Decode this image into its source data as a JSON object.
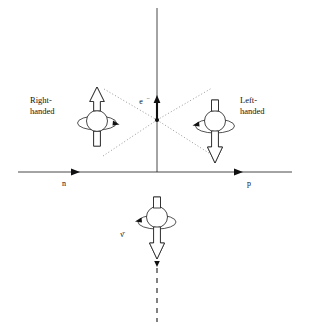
{
  "figure": {
    "background_color": "#ffffff",
    "ink_color": "#1a1a1a",
    "dotted_color": "#8d8d8d",
    "width": 310,
    "height": 326
  },
  "axes": {
    "horizontal": {
      "label_left": "n",
      "label_right": "p",
      "y": 172,
      "x_start": 18,
      "x_end": 292,
      "arrow_left_x": 78,
      "arrow_right_x": 242,
      "label_left_x": 64,
      "label_right_x": 248,
      "label_y": 183
    },
    "vertical": {
      "x": 157,
      "y_top": 8,
      "y_bottom": 172
    },
    "origin": {
      "x": 157,
      "y": 172
    }
  },
  "vertex": {
    "x": 157,
    "y": 120,
    "description": "interaction vertex where dotted lines cross"
  },
  "electron": {
    "label": "e−",
    "label_display": "e",
    "superscript": "−",
    "label_x": 143,
    "label_y": 101,
    "momentum_arrow": {
      "direction": "up",
      "x": 157,
      "y_tail": 120,
      "y_head": 97
    }
  },
  "antineutrino": {
    "label": "ν̄",
    "label_x": 122,
    "label_y": 234,
    "direction": "down",
    "dashed_track": {
      "x": 157,
      "y_start": 262,
      "y_end": 322
    }
  },
  "particles": [
    {
      "id": "right-handed-electron",
      "label_line1": "Right-",
      "label_line2": "handed",
      "label_x": 30,
      "label_y": 100,
      "center_x": 97,
      "center_y": 121,
      "spin_arrow_direction": "up",
      "ring_arrowhead_side": "right",
      "helicity": "right-handed"
    },
    {
      "id": "left-handed-electron",
      "label_line1": "Left-",
      "label_line2": "handed",
      "label_x": 240,
      "label_y": 100,
      "center_x": 215,
      "center_y": 121,
      "spin_arrow_direction": "down",
      "ring_arrowhead_side": "left",
      "helicity": "left-handed"
    },
    {
      "id": "antineutrino-particle",
      "label_line1": "ν̄",
      "label_line2": "",
      "label_x": 122,
      "label_y": 234,
      "center_x": 157,
      "center_y": 218,
      "spin_arrow_direction": "down",
      "ring_arrowhead_side": "left",
      "helicity": "right-handed"
    }
  ],
  "dotted_lines": [
    {
      "id": "dotted-upper-left",
      "x1": 104,
      "y1": 89,
      "x2": 157,
      "y2": 120
    },
    {
      "id": "dotted-lower-right",
      "x1": 157,
      "y1": 120,
      "x2": 212,
      "y2": 155
    },
    {
      "id": "dotted-lower-left",
      "x1": 103,
      "y1": 156,
      "x2": 157,
      "y2": 120
    },
    {
      "id": "dotted-upper-right",
      "x1": 157,
      "y1": 120,
      "x2": 212,
      "y2": 88
    }
  ]
}
